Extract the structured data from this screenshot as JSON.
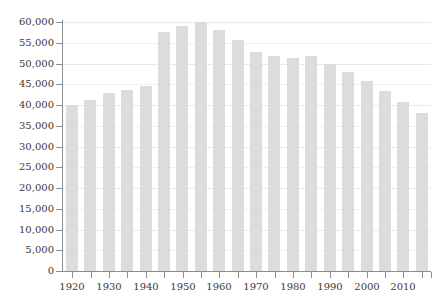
{
  "chart_data": {
    "type": "bar",
    "title": "",
    "subtitle": "",
    "xlabel": "",
    "ylabel": "",
    "categories": [
      "1920",
      "1925",
      "1930",
      "1935",
      "1940",
      "1945",
      "1950",
      "1955",
      "1960",
      "1965",
      "1970",
      "1975",
      "1980",
      "1985",
      "1990",
      "1995",
      "2000",
      "2005",
      "2010",
      "2015"
    ],
    "values": [
      40000,
      41200,
      42800,
      43700,
      44700,
      57600,
      59000,
      60000,
      58100,
      55700,
      52800,
      51800,
      51400,
      51700,
      50000,
      47900,
      45700,
      43400,
      40700,
      38100
    ],
    "series": [
      {
        "name": "",
        "values": [
          40000,
          41200,
          42800,
          43700,
          44700,
          57600,
          59000,
          60000,
          58100,
          55700,
          52800,
          51800,
          51400,
          51700,
          50000,
          47900,
          45700,
          43400,
          40700,
          38100
        ]
      }
    ],
    "ylim": [
      0,
      60000
    ],
    "ytick_labels": [
      "60,000",
      "55,000",
      "50,000",
      "45,000",
      "40,000",
      "35,000",
      "30,000",
      "25,000",
      "20,000",
      "15,000",
      "10,000",
      "5,000",
      "0"
    ],
    "ytick_values": [
      60000,
      55000,
      50000,
      45000,
      40000,
      35000,
      30000,
      25000,
      20000,
      15000,
      10000,
      5000,
      0
    ],
    "xtick_labels": [
      "1920",
      "1930",
      "1940",
      "1950",
      "1960",
      "1970",
      "1980",
      "1990",
      "2000",
      "2010"
    ],
    "xtick_values": [
      1920,
      1930,
      1940,
      1950,
      1960,
      1970,
      1980,
      1990,
      2000,
      2010
    ],
    "grid": true,
    "grid_axis": "y",
    "legend": false,
    "legend_position": "none",
    "bar_color": "#dcdcdc",
    "grid_color": "#eaeaea",
    "axis_color": "#8c8c8c",
    "text_color": "#3a3a3a",
    "background_color": "#ffffff",
    "annotations": []
  }
}
